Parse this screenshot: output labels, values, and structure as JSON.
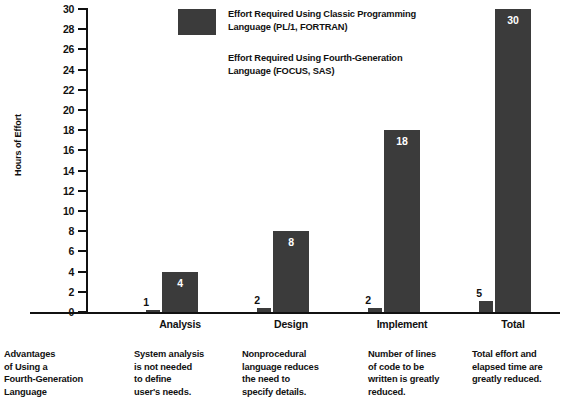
{
  "chart_data": {
    "type": "bar",
    "title": "",
    "xlabel": "",
    "ylabel": "Hours of Effort",
    "ylim": [
      0,
      30
    ],
    "ytick_step": 2,
    "yticks": [
      30,
      28,
      26,
      24,
      22,
      20,
      18,
      16,
      14,
      12,
      10,
      8,
      6,
      4,
      2,
      0
    ],
    "categories": [
      "Analysis",
      "Design",
      "Implement",
      "Total"
    ],
    "grid": false,
    "legend_position": "top-center",
    "series": [
      {
        "name": "Effort Required Using Classic Programming Language (PL/1, FORTRAN)",
        "values": [
          4,
          8,
          18,
          30
        ],
        "color": "#3b3b3b"
      },
      {
        "name": "Effort Required Using Fourth-Generation Language (FOCUS, SAS)",
        "values": [
          1,
          2,
          2,
          5
        ],
        "color": "#3b3b3b"
      }
    ]
  },
  "axis": {
    "y_title": "Hours of Effort"
  },
  "legend": {
    "entries": [
      {
        "label": "Effort Required Using Classic Programming\nLanguage (PL/1, FORTRAN)",
        "swatch": "filled"
      },
      {
        "label": "Effort Required Using Fourth-Generation\nLanguage (FOCUS, SAS)",
        "swatch": "blank"
      }
    ]
  },
  "captions": [
    "Advantages\nof Using a\nFourth-Generation\nLanguage",
    "System analysis\nis not needed\nto define\nuser's needs.",
    "Nonprocedural\nlanguage reduces\nthe need to\nspecify details.",
    "Number of lines\nof code to be\nwritten is greatly\nreduced.",
    "Total effort and\nelapsed time are\ngreatly reduced."
  ],
  "colors": {
    "bar": "#3b3b3b",
    "axis": "#111111",
    "background": "#ffffff",
    "value_label": "#ffffff"
  }
}
